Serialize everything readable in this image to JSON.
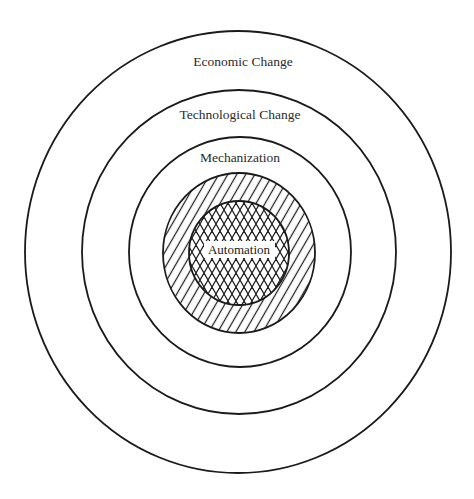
{
  "diagram": {
    "type": "nested-concentric-circles",
    "colors": {
      "stroke": "#1a1a1a",
      "text": "#2a2a2a",
      "background": "#ffffff"
    },
    "rings": [
      {
        "id": "economic",
        "label": "Economic Change",
        "fill": "none"
      },
      {
        "id": "technological",
        "label": "Technological Change",
        "fill": "none"
      },
      {
        "id": "mechanization",
        "label": "Mechanization",
        "fill": "none"
      },
      {
        "id": "hatched-band",
        "label": "",
        "fill": "diagonal-hatch"
      },
      {
        "id": "automation",
        "label": "Automation",
        "fill": "cross-hatch"
      }
    ]
  }
}
